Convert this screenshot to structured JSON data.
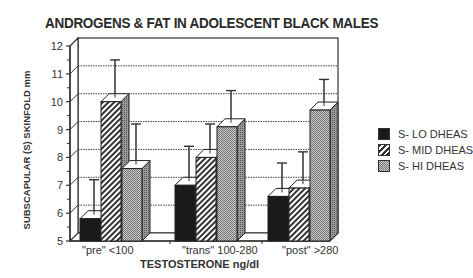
{
  "chart_data": {
    "type": "bar",
    "title": "ANDROGENS & FAT IN ADOLESCENT BLACK MALES",
    "xlabel": "TESTOSTERONE ng/dl",
    "ylabel": "SUBSCAPULAR (S) SKINFOLD  mm",
    "ylim": [
      5,
      12
    ],
    "yticks": [
      5,
      6,
      7,
      8,
      9,
      10,
      11,
      12
    ],
    "grid": true,
    "legend_position": "right",
    "categories": [
      "\"pre\"  <100",
      "\"trans\"  100-280",
      "\"post\"  >280"
    ],
    "series": [
      {
        "name": "S- LO DHEAS",
        "values": [
          5.8,
          7.0,
          6.6
        ],
        "error_upper": [
          7.2,
          8.4,
          7.8
        ],
        "color": "#1a1a1a",
        "pattern": "solid"
      },
      {
        "name": "S- MID DHEAS",
        "values": [
          10.0,
          8.0,
          6.9
        ],
        "error_upper": [
          11.5,
          9.2,
          8.2
        ],
        "color": "#555555",
        "pattern": "diagonal-hatch"
      },
      {
        "name": "S- HI DHEAS",
        "values": [
          7.6,
          9.1,
          9.7
        ],
        "error_upper": [
          9.2,
          10.4,
          10.8
        ],
        "color": "#aaaaaa",
        "pattern": "dotted"
      }
    ]
  },
  "labels": {
    "title": "ANDROGENS & FAT IN ADOLESCENT BLACK MALES",
    "ylabel": "SUBSCAPULAR (S) SKINFOLD  mm",
    "xlabel": "TESTOSTERONE ng/dl",
    "cat0": "\"pre\"  <100",
    "cat1": "\"trans\"  100-280",
    "cat2": "\"post\"  >280",
    "legend0": "S- LO DHEAS",
    "legend1": "S- MID DHEAS",
    "legend2": "S- HI DHEAS"
  }
}
